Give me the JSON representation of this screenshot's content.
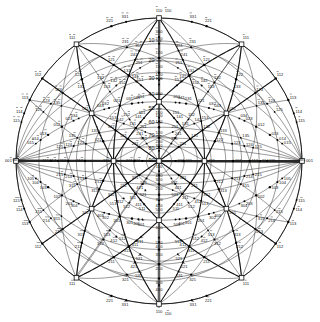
{
  "figure": {
    "kind": "stereographic-projection",
    "projection_plane": "110",
    "crystal_system": "cubic",
    "center_pole": "110",
    "radius": 143,
    "cx": 159,
    "cy": 161,
    "line_color": "#111111",
    "marker_color": "#000000",
    "background": "#ffffff"
  },
  "degree_ticks": {
    "axis": "vertical-upper",
    "labels": [
      "90",
      "80",
      "70",
      "60",
      "50",
      "40",
      "30",
      "20",
      "10"
    ],
    "values": [
      90,
      80,
      70,
      60,
      50,
      40,
      30,
      20,
      10
    ]
  },
  "cardinal_poles": [
    {
      "label": "110",
      "bar": "0",
      "x": 159,
      "y": 12,
      "type": "open",
      "anchor": "above"
    },
    {
      "label": "110",
      "bar": "1",
      "x": 159,
      "y": 310,
      "type": "open",
      "anchor": "below"
    },
    {
      "label": "001",
      "bar": "1",
      "x": 12,
      "y": 161,
      "type": "open",
      "anchor": "left"
    },
    {
      "label": "001",
      "bar": "0",
      "x": 306,
      "y": 161,
      "type": "open",
      "anchor": "right"
    },
    {
      "label": "110",
      "bar": "0",
      "x": 159,
      "y": 161,
      "type": "center",
      "anchor": "below"
    }
  ],
  "major_poles": [
    {
      "label": "111",
      "bar": "1",
      "x": 72,
      "y": 46
    },
    {
      "label": "111",
      "bar": "2",
      "x": 246,
      "y": 46
    },
    {
      "label": "111",
      "bar": "3",
      "x": 72,
      "y": 276
    },
    {
      "label": "111",
      "bar": "4",
      "x": 246,
      "y": 276
    },
    {
      "label": "100",
      "bar": "0",
      "x": 159,
      "y": 101
    },
    {
      "label": "010",
      "bar": "0",
      "x": 159,
      "y": 221
    },
    {
      "label": "111",
      "bar": "5",
      "x": 104,
      "y": 161
    },
    {
      "label": "111",
      "bar": "6",
      "x": 214,
      "y": 161
    },
    {
      "label": "101",
      "bar": "0",
      "x": 86,
      "y": 101
    },
    {
      "label": "011",
      "bar": "0",
      "x": 86,
      "y": 221
    },
    {
      "label": "101",
      "bar": "1",
      "x": 232,
      "y": 101
    },
    {
      "label": "011",
      "bar": "1",
      "x": 232,
      "y": 221
    }
  ],
  "pole_labels_q1": [
    "221",
    "321",
    "331",
    "211",
    "311",
    "411",
    "421",
    "521",
    "321",
    "210",
    "320",
    "310",
    "201",
    "301",
    "401",
    "302",
    "212",
    "213",
    "203",
    "102",
    "103",
    "112",
    "113",
    "213",
    "212",
    "340",
    "240",
    "140",
    "231",
    "121",
    "131",
    "132",
    "122",
    "123",
    "023",
    "032",
    "021",
    "031",
    "041",
    "042",
    "043",
    "511",
    "512",
    "010"
  ],
  "annotations": {
    "sample_indices": [
      "100",
      "110",
      "111",
      "210",
      "211",
      "221",
      "310",
      "311",
      "320",
      "321",
      "331",
      "410",
      "411",
      "421",
      "430",
      "510",
      "511",
      "520",
      "521",
      "531",
      "201",
      "203",
      "101",
      "102",
      "103",
      "112",
      "113",
      "122",
      "123",
      "132",
      "133",
      "212",
      "213",
      "231",
      "232",
      "301",
      "302",
      "311",
      "312",
      "313",
      "021",
      "023",
      "031",
      "032",
      "041",
      "042",
      "043",
      "011",
      "012",
      "013",
      "120",
      "130",
      "140",
      "230",
      "240",
      "340",
      "012",
      "013"
    ],
    "title": ""
  },
  "poles": [
    {
      "i": "110",
      "b": 0,
      "r": 0.0,
      "a": 0.0,
      "m": "open",
      "lp": "s"
    },
    {
      "i": "110",
      "b": 1,
      "r": 1.0,
      "a": 90.0,
      "m": "open",
      "lp": "n"
    },
    {
      "i": "110",
      "b": 1,
      "r": 1.0,
      "a": 270.0,
      "m": "open",
      "lp": "s"
    },
    {
      "i": "001",
      "b": 1,
      "r": 1.0,
      "a": 180.0,
      "m": "open",
      "lp": "w"
    },
    {
      "i": "001",
      "b": 0,
      "r": 1.0,
      "a": 0.0,
      "m": "open",
      "lp": "e"
    },
    {
      "i": "100",
      "b": 0,
      "r": 0.414,
      "a": 90.0,
      "m": "open",
      "lp": "e"
    },
    {
      "i": "010",
      "b": 0,
      "r": 0.414,
      "a": 270.0,
      "m": "open",
      "lp": "s"
    },
    {
      "i": "111",
      "b": 0,
      "r": 0.383,
      "a": 0.0,
      "m": "open",
      "lp": "s"
    },
    {
      "i": "111",
      "b": 2,
      "r": 0.383,
      "a": 180.0,
      "m": "open",
      "lp": "s"
    },
    {
      "i": "111",
      "b": 1,
      "r": 0.79,
      "a": 55.0,
      "m": "open",
      "lp": "n"
    },
    {
      "i": "111",
      "b": 3,
      "r": 0.79,
      "a": 125.0,
      "m": "open",
      "lp": "n"
    },
    {
      "i": "111",
      "b": 4,
      "r": 0.79,
      "a": 235.0,
      "m": "open",
      "lp": "s"
    },
    {
      "i": "111",
      "b": 5,
      "r": 0.79,
      "a": 305.0,
      "m": "open",
      "lp": "s"
    },
    {
      "i": "101",
      "b": 0,
      "r": 0.575,
      "a": 124.0,
      "m": "open",
      "lp": "w"
    },
    {
      "i": "101",
      "b": 1,
      "r": 0.575,
      "a": 56.0,
      "m": "open",
      "lp": "e"
    },
    {
      "i": "011",
      "b": 0,
      "r": 0.575,
      "a": 236.0,
      "m": "open",
      "lp": "w"
    },
    {
      "i": "011",
      "b": 1,
      "r": 0.575,
      "a": 304.0,
      "m": "open",
      "lp": "e"
    }
  ]
}
